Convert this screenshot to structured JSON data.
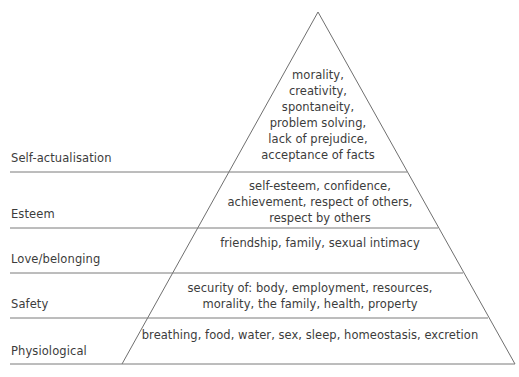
{
  "diagram": {
    "type": "pyramid",
    "geometry": {
      "apex_x": 318,
      "apex_y": 12,
      "base_left_x": 122,
      "base_right_x": 515,
      "base_y": 364,
      "axis_left_x": 10,
      "stroke_color": "#6f6f6f",
      "text_color": "#3c3c3c",
      "background_color": "#ffffff"
    },
    "tiers": [
      {
        "id": "self-actualisation",
        "label": "Self-actualisation",
        "label_x": 11,
        "label_y": 151,
        "divider_y": 172,
        "content_lines": [
          "morality,",
          "creativity,",
          "spontaneity,",
          "problem solving,",
          "lack of prejudice,",
          "acceptance of facts"
        ],
        "content_top": 67,
        "content_left": 228,
        "content_width": 180
      },
      {
        "id": "esteem",
        "label": "Esteem",
        "label_x": 11,
        "label_y": 207,
        "divider_y": 228,
        "content_lines": [
          "self-esteem, confidence,",
          "achievement, respect of others,",
          "respect by others"
        ],
        "content_top": 178,
        "content_left": 200,
        "content_width": 240
      },
      {
        "id": "love-belonging",
        "label": "Love/belonging",
        "label_x": 11,
        "label_y": 252,
        "divider_y": 273,
        "content_lines": [
          "friendship, family, sexual intimacy"
        ],
        "content_top": 235,
        "content_left": 180,
        "content_width": 280
      },
      {
        "id": "safety",
        "label": "Safety",
        "label_x": 11,
        "label_y": 297,
        "divider_y": 318,
        "content_lines": [
          "security of: body, employment, resources,",
          "morality, the family, health, property"
        ],
        "content_top": 280,
        "content_left": 150,
        "content_width": 320
      },
      {
        "id": "physiological",
        "label": "Physiological",
        "label_x": 11,
        "label_y": 344,
        "divider_y": 364,
        "content_lines": [
          "breathing, food, water, sex, sleep, homeostasis, excretion"
        ],
        "content_top": 327,
        "content_left": 130,
        "content_width": 360
      }
    ]
  }
}
